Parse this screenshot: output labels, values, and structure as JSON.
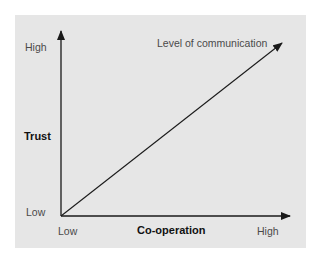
{
  "diagram": {
    "type": "line-relationship",
    "y_axis": {
      "title": "Trust",
      "high_label": "High",
      "low_label": "Low"
    },
    "x_axis": {
      "title": "Co-operation",
      "low_label": "Low",
      "high_label": "High"
    },
    "line": {
      "label": "Level of communication",
      "from": "Low/Low",
      "to": "High/High"
    },
    "colors": {
      "panel_background": "#e6e6e6",
      "axis": "#1a1a1a",
      "text": "#4a4a4a",
      "bold_text": "#111111"
    }
  }
}
